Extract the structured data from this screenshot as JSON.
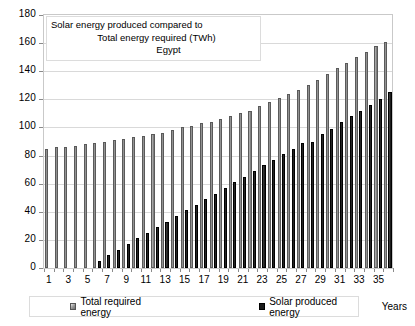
{
  "chart_data": {
    "type": "bar",
    "title": "Solar energy produced compared to Total energy required (TWh) Egypt",
    "title_lines": [
      "Solar energy produced compared to",
      "Total energy required (TWh)",
      "Egypt"
    ],
    "xlabel": "Years",
    "ylabel": "",
    "ylim": [
      0,
      180
    ],
    "ytick_step": 20,
    "grid": true,
    "legend_position": "bottom",
    "categories": [
      1,
      2,
      3,
      4,
      5,
      6,
      7,
      8,
      9,
      10,
      11,
      12,
      13,
      14,
      15,
      16,
      17,
      18,
      19,
      20,
      21,
      22,
      23,
      24,
      25,
      26,
      27,
      28,
      29,
      30,
      31,
      32,
      33,
      34,
      35,
      36
    ],
    "xtick_labels": [
      "1",
      "3",
      "5",
      "7",
      "9",
      "11",
      "13",
      "15",
      "17",
      "19",
      "21",
      "23",
      "25",
      "27",
      "29",
      "31",
      "33",
      "35"
    ],
    "ytick_labels": [
      "0",
      "20",
      "40",
      "60",
      "80",
      "100",
      "120",
      "140",
      "160",
      "180"
    ],
    "series": [
      {
        "name": "Total required energy",
        "color": "#8f8f8f",
        "values": [
          85,
          86,
          86,
          87,
          88,
          89,
          90,
          91,
          92,
          93,
          94,
          95,
          96,
          98,
          100,
          101,
          103,
          104,
          106,
          108,
          110,
          112,
          115,
          118,
          121,
          124,
          127,
          130,
          134,
          138,
          142,
          146,
          150,
          154,
          158,
          161
        ]
      },
      {
        "name": "Solar produced energy",
        "color": "#1b1b1b",
        "values": [
          0,
          0,
          0,
          0,
          0,
          5,
          9,
          13,
          17,
          21,
          25,
          29,
          33,
          37,
          41,
          45,
          49,
          53,
          57,
          61,
          65,
          69,
          73,
          77,
          81,
          85,
          89,
          90,
          95,
          99,
          104,
          108,
          112,
          116,
          120,
          125
        ]
      }
    ],
    "legend": [
      {
        "label": "Total required energy",
        "swatch": "gray-square"
      },
      {
        "label": "Solar produced energy",
        "swatch": "black-square"
      }
    ]
  }
}
